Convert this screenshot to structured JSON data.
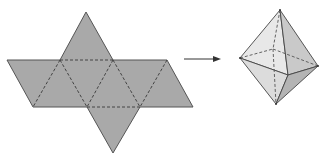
{
  "figure": {
    "net": {
      "label": "octahedron net",
      "fill": "#a9a9a9",
      "stroke": "#555555",
      "fold_line_style": "dashed",
      "faces": 8,
      "points": {
        "top_apex": [
          86,
          12
        ],
        "top_row": [
          [
            7,
            60
          ],
          [
            60,
            60
          ],
          [
            113,
            60
          ],
          [
            167,
            60
          ]
        ],
        "bottom_row": [
          [
            33,
            107
          ],
          [
            87,
            107
          ],
          [
            140,
            107
          ],
          [
            193,
            107
          ]
        ],
        "bottom_apex": [
          113,
          153
        ]
      }
    },
    "arrow": {
      "label": "folds into",
      "from": [
        184,
        59
      ],
      "to": [
        221,
        59
      ],
      "color": "#333333"
    },
    "octahedron": {
      "label": "octahedron",
      "stroke": "#444444",
      "vertices": {
        "top": [
          280,
          10
        ],
        "left": [
          240,
          58
        ],
        "right": [
          318,
          66
        ],
        "front": [
          288,
          75
        ],
        "back": [
          273,
          49
        ],
        "bottom": [
          276,
          104
        ]
      },
      "face_colors": {
        "upper_left": "#e8e8e8",
        "upper_right": "#c9c9c9",
        "lower_left": "#dcdcdc",
        "lower_right": "#b4b4b4"
      }
    }
  }
}
